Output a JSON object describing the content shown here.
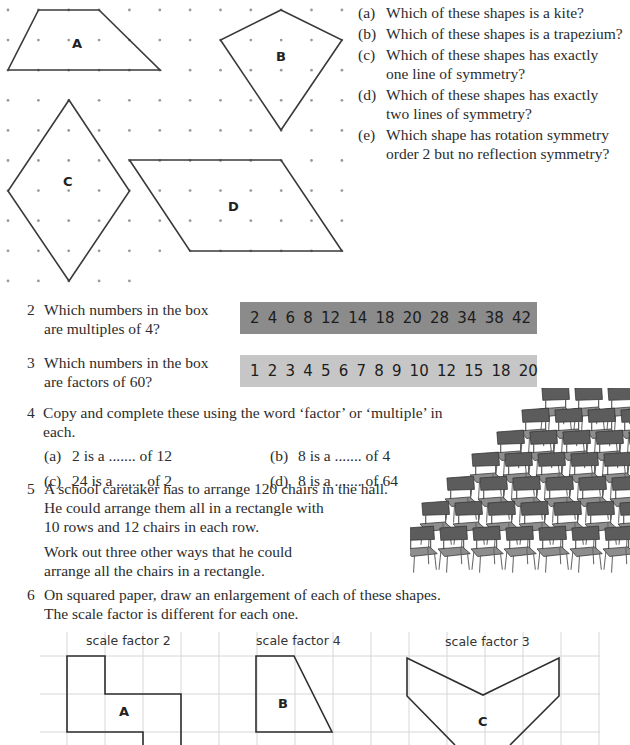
{
  "question1": {
    "shapes": [
      {
        "id": "A",
        "name": "trapezium"
      },
      {
        "id": "B",
        "name": "kite"
      },
      {
        "id": "C",
        "name": "rhombus"
      },
      {
        "id": "D",
        "name": "parallelogram"
      }
    ],
    "parts": [
      {
        "label": "(a)",
        "line1": "Which of these shapes is a kite?",
        "line2": ""
      },
      {
        "label": "(b)",
        "line1": "Which of these shapes is a trapezium?",
        "line2": ""
      },
      {
        "label": "(c)",
        "line1": "Which of these shapes has exactly",
        "line2": "one line of symmetry?"
      },
      {
        "label": "(d)",
        "line1": "Which of these shapes has exactly",
        "line2": "two lines of symmetry?"
      },
      {
        "label": "(e)",
        "line1": "Which shape has rotation symmetry",
        "line2": "order 2 but no reflection symmetry?"
      }
    ]
  },
  "question2": {
    "number": "2",
    "line1": "Which numbers in the box",
    "line2": "are multiples of 4?",
    "box_numbers": [
      "2",
      "4",
      "6",
      "8",
      "12",
      "14",
      "18",
      "20",
      "28",
      "34",
      "38",
      "42"
    ],
    "box_color": "#8b8b8b"
  },
  "question3": {
    "number": "3",
    "line1": "Which numbers in the box",
    "line2": "are factors of 60?",
    "box_numbers": [
      "1",
      "2",
      "3",
      "4",
      "5",
      "6",
      "7",
      "8",
      "9",
      "10",
      "12",
      "15",
      "18",
      "20"
    ],
    "box_color": "#c6c6c6"
  },
  "question4": {
    "number": "4",
    "intro": "Copy and complete these using the word ‘factor’ or ‘multiple’ in each.",
    "parts": [
      {
        "label": "(a)",
        "text": "2 is a ....... of 12"
      },
      {
        "label": "(b)",
        "text": "8 is a ....... of 4"
      },
      {
        "label": "(c)",
        "text": "24 is a ....... of 2"
      },
      {
        "label": "(d)",
        "text": "8 is a ....... of 64"
      }
    ]
  },
  "question5": {
    "number": "5",
    "line1": "A school caretaker has to arrange 120 chairs in the hall.",
    "line2": "He could arrange them all in a rectangle with",
    "line3": "10 rows and 12 chairs in each row.",
    "line4": "Work out three other ways that he could",
    "line5": "arrange all the chairs in a rectangle.",
    "illustration": "stacked-chairs-illustration"
  },
  "question6": {
    "number": "6",
    "line1": "On squared paper, draw an enlargement of each of these shapes.",
    "line2": "The scale factor is different for each one.",
    "shapes": [
      {
        "id": "A",
        "caption": "scale factor 2"
      },
      {
        "id": "B",
        "caption": "scale factor 4"
      },
      {
        "id": "C",
        "caption": "scale factor 3"
      }
    ]
  }
}
